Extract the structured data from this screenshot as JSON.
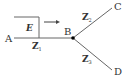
{
  "diagram": {
    "nodes": {
      "A": {
        "label": "A"
      },
      "B": {
        "label": "B"
      },
      "C": {
        "label": "C"
      },
      "D": {
        "label": "D"
      }
    },
    "wave": {
      "label": "E"
    },
    "impedances": {
      "z1": {
        "base": "Z",
        "sub": "1"
      },
      "z2": {
        "base": "Z",
        "sub": "2"
      },
      "z3": {
        "base": "Z",
        "sub": "3"
      }
    },
    "colors": {
      "line": "#666666",
      "text": "#333333",
      "node": "#000000"
    }
  }
}
